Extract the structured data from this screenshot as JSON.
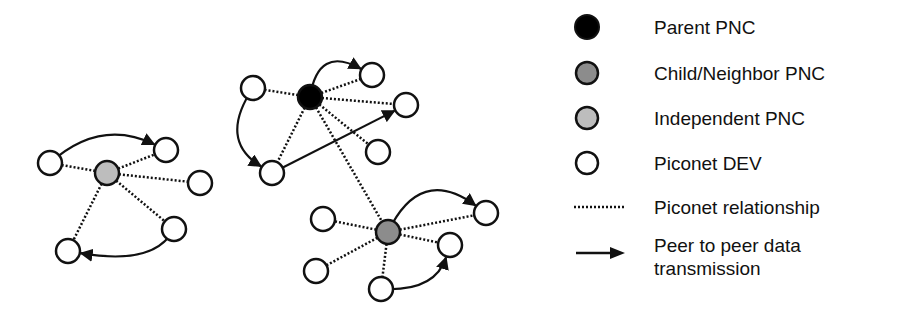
{
  "colors": {
    "parent_pnc": "#000000",
    "child_neighbor_pnc": "#8c8c8c",
    "independent_pnc": "#bdbdbd",
    "piconet_dev": "#ffffff",
    "stroke": "#111111",
    "background": "#ffffff"
  },
  "legend": {
    "items": [
      {
        "symbol": "filled-circle-black",
        "label": "Parent PNC"
      },
      {
        "symbol": "filled-circle-dark-gray",
        "label": "Child/Neighbor PNC"
      },
      {
        "symbol": "filled-circle-light-gray",
        "label": "Independent PNC"
      },
      {
        "symbol": "hollow-circle",
        "label": "Piconet DEV"
      },
      {
        "symbol": "dotted-line",
        "label": "Piconet relationship"
      },
      {
        "symbol": "solid-arrow",
        "label": "Peer to peer data transmission"
      }
    ]
  },
  "diagram": {
    "node_radius": 12,
    "piconets": [
      {
        "name": "independent-piconet",
        "coordinator": {
          "type": "independent_pnc",
          "x": 107,
          "y": 173
        },
        "devices": [
          {
            "x": 50,
            "y": 163
          },
          {
            "x": 166,
            "y": 150
          },
          {
            "x": 200,
            "y": 183
          },
          {
            "x": 174,
            "y": 229
          },
          {
            "x": 68,
            "y": 251
          }
        ],
        "transmissions": [
          {
            "from": [
              50,
              163
            ],
            "to": [
              166,
              150
            ],
            "curve": [
              100,
              118
            ]
          },
          {
            "from": [
              174,
              229
            ],
            "to": [
              68,
              251
            ],
            "curve": [
              155,
              266
            ]
          }
        ]
      },
      {
        "name": "parent-piconet",
        "coordinator": {
          "type": "parent_pnc",
          "x": 310,
          "y": 97
        },
        "devices": [
          {
            "x": 253,
            "y": 88
          },
          {
            "x": 372,
            "y": 75
          },
          {
            "x": 406,
            "y": 105
          },
          {
            "x": 378,
            "y": 152
          },
          {
            "x": 272,
            "y": 173
          }
        ],
        "transmissions": [
          {
            "from": [
              310,
              97
            ],
            "to": [
              372,
              75
            ],
            "curve": [
              318,
              45
            ]
          },
          {
            "from": [
              253,
              88
            ],
            "to": [
              272,
              173
            ],
            "curve": [
              218,
              140
            ]
          },
          {
            "from": [
              272,
              173
            ],
            "to": [
              406,
              105
            ],
            "curve": null
          }
        ]
      },
      {
        "name": "child-piconet",
        "coordinator": {
          "type": "child_neighbor_pnc",
          "x": 388,
          "y": 232
        },
        "devices": [
          {
            "x": 323,
            "y": 219
          },
          {
            "x": 486,
            "y": 213
          },
          {
            "x": 450,
            "y": 245
          },
          {
            "x": 316,
            "y": 271
          },
          {
            "x": 381,
            "y": 289
          }
        ],
        "transmissions": [
          {
            "from": [
              388,
              232
            ],
            "to": [
              486,
              213
            ],
            "curve": [
              420,
              165
            ]
          },
          {
            "from": [
              381,
              289
            ],
            "to": [
              450,
              245
            ],
            "curve": [
              435,
              292
            ]
          }
        ]
      }
    ],
    "inter_piconet_links": [
      {
        "from": [
          310,
          97
        ],
        "to": [
          388,
          232
        ],
        "style": "dotted"
      }
    ]
  }
}
